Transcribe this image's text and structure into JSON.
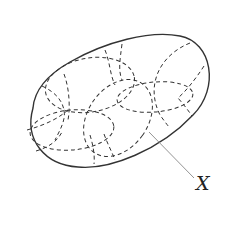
{
  "figure": {
    "label": "X",
    "colors": {
      "boundary": "#333333",
      "dashed": "#333333",
      "leader": "#888888",
      "background": "#ffffff"
    }
  }
}
